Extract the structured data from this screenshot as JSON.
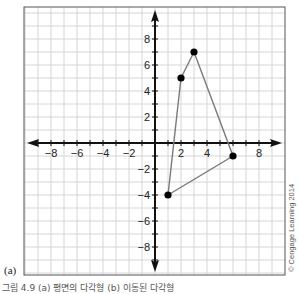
{
  "chart_data": {
    "type": "scatter",
    "title": "",
    "xlabel": "",
    "ylabel": "",
    "xlim": [
      -10,
      10
    ],
    "ylim": [
      -10,
      10
    ],
    "grid": true,
    "x_tick_labels": [
      "-8",
      "-6",
      "-4",
      "-2",
      "2",
      "4",
      "8"
    ],
    "x_tick_values": [
      -8,
      -6,
      -4,
      -2,
      2,
      4,
      8
    ],
    "y_tick_labels": [
      "8",
      "6",
      "4",
      "2",
      "-2",
      "-4",
      "-6",
      "-8"
    ],
    "y_tick_values": [
      8,
      6,
      4,
      2,
      -2,
      -4,
      -6,
      -8
    ],
    "series": [
      {
        "name": "polygon",
        "closed": true,
        "points": [
          [
            2,
            5
          ],
          [
            3,
            7
          ],
          [
            6,
            -1
          ],
          [
            1,
            -4
          ]
        ],
        "line_color": "#7a7a7a",
        "point_color": "#000000"
      }
    ],
    "panel_label": "(a)",
    "credit": "© Cengage Learning 2014"
  },
  "caption": "그림 4.9  (a) 평면의 다각형  (b) 이동된 다각형"
}
